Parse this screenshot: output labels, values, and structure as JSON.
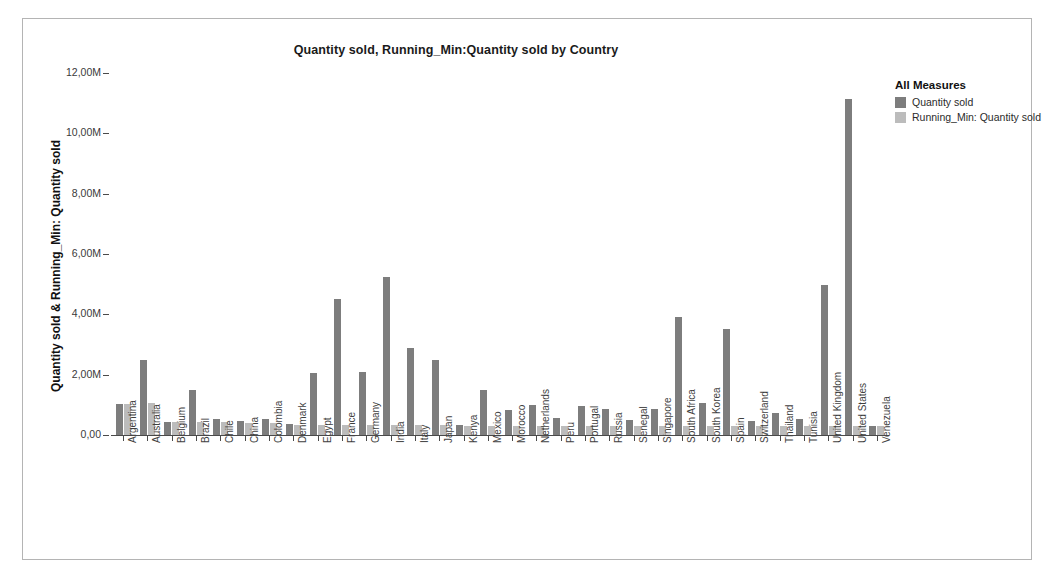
{
  "chart": {
    "title": "Quantity sold, Running_Min:Quantity sold by Country",
    "y_axis_title": "Quantity sold & Running_Min: Quantity sold"
  },
  "legend": {
    "title": "All Measures",
    "items": [
      {
        "label": "Quantity sold",
        "color": "#7d7d7d"
      },
      {
        "label": "Running_Min: Quantity sold",
        "color": "#bcbcbc"
      }
    ]
  },
  "chart_data": {
    "type": "bar",
    "title": "Quantity sold, Running_Min:Quantity sold by Country",
    "xlabel": "",
    "ylabel": "Quantity sold & Running_Min: Quantity sold",
    "ylim": [
      0,
      12000000
    ],
    "ytick_labels": [
      "0,00",
      "2,00M",
      "4,00M",
      "6,00M",
      "8,00M",
      "10,00M",
      "12,00M"
    ],
    "ytick_values": [
      0,
      2000000,
      4000000,
      6000000,
      8000000,
      10000000,
      12000000
    ],
    "grid": false,
    "legend_position": "right",
    "categories": [
      "Argentina",
      "Australia",
      "Belgium",
      "Brazil",
      "Chile",
      "China",
      "Colombia",
      "Denmark",
      "Egypt",
      "France",
      "Germany",
      "India",
      "Italy",
      "Japan",
      "Kenya",
      "Mexico",
      "Morocco",
      "Netherlands",
      "Peru",
      "Portugal",
      "Russia",
      "Senegal",
      "Singapore",
      "South Africa",
      "South Korea",
      "Spain",
      "Switzerland",
      "Thailand",
      "Tunisia",
      "United Kingdom",
      "United States",
      "Venezuela"
    ],
    "series": [
      {
        "name": "Quantity sold",
        "color": "#7d7d7d",
        "values": [
          1020000,
          2500000,
          420000,
          1500000,
          520000,
          480000,
          540000,
          360000,
          2050000,
          4500000,
          2100000,
          5250000,
          2900000,
          2480000,
          320000,
          1500000,
          820000,
          980000,
          580000,
          950000,
          850000,
          500000,
          850000,
          3900000,
          1050000,
          3500000,
          480000,
          730000,
          520000,
          4980000,
          11150000,
          300000
        ]
      },
      {
        "name": "Running_Min: Quantity sold",
        "color": "#bcbcbc",
        "values": [
          1020000,
          1050000,
          420000,
          420000,
          420000,
          400000,
          400000,
          330000,
          330000,
          330000,
          330000,
          330000,
          330000,
          330000,
          310000,
          310000,
          310000,
          310000,
          310000,
          310000,
          310000,
          310000,
          310000,
          300000,
          300000,
          300000,
          300000,
          300000,
          300000,
          300000,
          300000,
          290000
        ]
      }
    ]
  }
}
